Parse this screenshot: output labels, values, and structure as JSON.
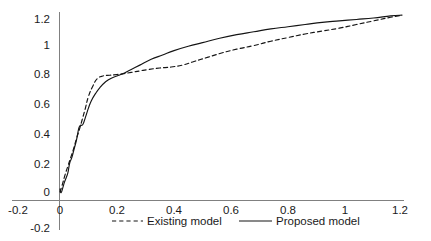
{
  "chart_data": {
    "type": "line",
    "title": "",
    "xlabel": "",
    "ylabel": "",
    "xlim": [
      -0.2,
      1.2
    ],
    "ylim": [
      -0.2,
      1.2
    ],
    "grid": false,
    "legend_position": "bottom",
    "x_ticks": [
      "-0.2",
      "0",
      "0.2",
      "0.4",
      "0.6",
      "0.8",
      "1",
      "1.2"
    ],
    "x_tick_values": [
      -0.2,
      0,
      0.2,
      0.4,
      0.6,
      0.8,
      1,
      1.2
    ],
    "y_ticks": [
      "-0.2",
      "0",
      "0.2",
      "0.4",
      "0.6",
      "0.8",
      "1",
      "1.2"
    ],
    "y_tick_values": [
      -0.2,
      0,
      0.2,
      0.4,
      0.6,
      0.8,
      1,
      1.2
    ],
    "series": [
      {
        "name": "Existing model",
        "style": "dashed",
        "color": "#141414",
        "x": [
          0.0,
          0.008,
          0.018,
          0.028,
          0.038,
          0.048,
          0.058,
          0.068,
          0.078,
          0.088,
          0.1,
          0.115,
          0.13,
          0.15,
          0.175,
          0.2,
          0.22,
          0.25,
          0.28,
          0.31,
          0.35,
          0.39,
          0.43,
          0.47,
          0.52,
          0.57,
          0.62,
          0.68,
          0.74,
          0.8,
          0.86,
          0.92,
          0.98,
          1.04,
          1.1,
          1.16,
          1.2
        ],
        "y": [
          0.0,
          0.05,
          0.12,
          0.18,
          0.24,
          0.3,
          0.37,
          0.43,
          0.5,
          0.57,
          0.66,
          0.73,
          0.78,
          0.8,
          0.805,
          0.81,
          0.815,
          0.825,
          0.835,
          0.845,
          0.855,
          0.862,
          0.875,
          0.9,
          0.93,
          0.96,
          0.985,
          1.01,
          1.04,
          1.065,
          1.09,
          1.11,
          1.13,
          1.155,
          1.18,
          1.205,
          1.22
        ]
      },
      {
        "name": "Proposed model",
        "style": "solid",
        "color": "#141414",
        "x": [
          0.0,
          0.004,
          0.01,
          0.016,
          0.022,
          0.028,
          0.034,
          0.042,
          0.05,
          0.058,
          0.066,
          0.072,
          0.08,
          0.09,
          0.1,
          0.11,
          0.125,
          0.14,
          0.16,
          0.18,
          0.2,
          0.22,
          0.25,
          0.28,
          0.32,
          0.36,
          0.4,
          0.45,
          0.5,
          0.56,
          0.62,
          0.68,
          0.74,
          0.8,
          0.86,
          0.92,
          0.98,
          1.04,
          1.1,
          1.16,
          1.2
        ],
        "y": [
          0.02,
          -0.005,
          0.03,
          0.07,
          0.1,
          0.135,
          0.2,
          0.24,
          0.3,
          0.36,
          0.44,
          0.46,
          0.465,
          0.52,
          0.58,
          0.63,
          0.68,
          0.72,
          0.76,
          0.785,
          0.8,
          0.815,
          0.845,
          0.875,
          0.915,
          0.945,
          0.975,
          1.005,
          1.03,
          1.06,
          1.085,
          1.105,
          1.125,
          1.14,
          1.155,
          1.17,
          1.18,
          1.19,
          1.2,
          1.215,
          1.22
        ]
      }
    ],
    "annotations": []
  },
  "legend": {
    "items": [
      {
        "label": "Existing model",
        "style": "dashed"
      },
      {
        "label": "Proposed model",
        "style": "solid"
      }
    ]
  },
  "axes": {
    "y_axis_origin_label": "0",
    "x_axis_origin_label": "0"
  }
}
